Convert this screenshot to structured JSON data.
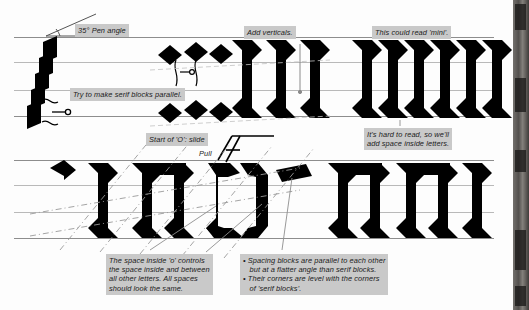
{
  "page": {
    "background_color": "#fdfdfd",
    "ink_color": "#000000",
    "rule_color": "#8d8d8d",
    "label_background": "#c9c9c9"
  },
  "labels": {
    "pen_angle": "35° Pen angle",
    "serif_parallel": "Try to make serif blocks parallel.",
    "add_verticals": "Add verticals.",
    "could_read_mini": "This could read 'mini'.",
    "start_of_o": "Start of 'O': slide",
    "pull": "Pull",
    "hard_to_read": "It's hard to read, so we'll\nadd space inside letters.",
    "space_inside_o": "The space inside 'o' controls\nthe space inside and between\nall other letters. All spaces\nshould look the same.",
    "spacing_bullets": "• Spacing blocks are parallel to each other\n   but at a flatter angle than serif blocks.\n• Their corners are level with the corners\n   of 'serif blocks'."
  },
  "letters": {
    "top_row_group_1": "iii",
    "top_row_group_2": "mini",
    "bottom_row_group_1": "i n o",
    "bottom_row_group_2": "mini"
  }
}
